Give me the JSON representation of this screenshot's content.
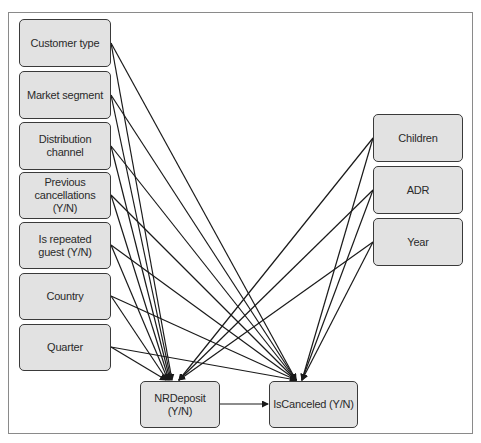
{
  "diagram": {
    "type": "causal-dag",
    "left_nodes": [
      {
        "id": "customer_type",
        "label": "Customer type"
      },
      {
        "id": "market_segment",
        "label": "Market segment"
      },
      {
        "id": "distribution_channel",
        "label": "Distribution channel"
      },
      {
        "id": "previous_cancellations",
        "label": "Previous cancellations (Y/N)"
      },
      {
        "id": "is_repeated_guest",
        "label": "Is repeated guest (Y/N)"
      },
      {
        "id": "country",
        "label": "Country"
      },
      {
        "id": "quarter",
        "label": "Quarter"
      }
    ],
    "right_nodes": [
      {
        "id": "children",
        "label": "Children"
      },
      {
        "id": "adr",
        "label": "ADR"
      },
      {
        "id": "year",
        "label": "Year"
      }
    ],
    "bottom_nodes": [
      {
        "id": "nrdeposit",
        "label": "NRDeposit (Y/N)"
      },
      {
        "id": "iscanceled",
        "label": "IsCanceled (Y/N)"
      }
    ],
    "edges": [
      [
        "customer_type",
        "nrdeposit"
      ],
      [
        "customer_type",
        "iscanceled"
      ],
      [
        "market_segment",
        "nrdeposit"
      ],
      [
        "market_segment",
        "iscanceled"
      ],
      [
        "distribution_channel",
        "nrdeposit"
      ],
      [
        "distribution_channel",
        "iscanceled"
      ],
      [
        "previous_cancellations",
        "nrdeposit"
      ],
      [
        "previous_cancellations",
        "iscanceled"
      ],
      [
        "is_repeated_guest",
        "nrdeposit"
      ],
      [
        "is_repeated_guest",
        "iscanceled"
      ],
      [
        "country",
        "nrdeposit"
      ],
      [
        "country",
        "iscanceled"
      ],
      [
        "quarter",
        "nrdeposit"
      ],
      [
        "quarter",
        "iscanceled"
      ],
      [
        "children",
        "nrdeposit"
      ],
      [
        "children",
        "iscanceled"
      ],
      [
        "adr",
        "nrdeposit"
      ],
      [
        "adr",
        "iscanceled"
      ],
      [
        "year",
        "nrdeposit"
      ],
      [
        "year",
        "iscanceled"
      ],
      [
        "nrdeposit",
        "iscanceled"
      ]
    ]
  }
}
